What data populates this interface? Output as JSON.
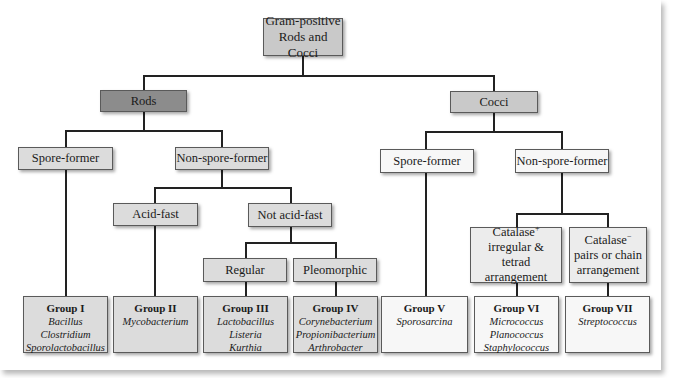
{
  "diagram": {
    "root": "Gram-positive Rods and Cocci",
    "rods": {
      "label": "Rods",
      "spore_former": "Spore-former",
      "non_spore_former": "Non-spore-former",
      "acid_fast": "Acid-fast",
      "not_acid_fast": "Not acid-fast",
      "regular": "Regular",
      "pleomorphic": "Pleomorphic"
    },
    "cocci": {
      "label": "Cocci",
      "spore_former": "Spore-former",
      "non_spore_former": "Non-spore-former",
      "catalase_pos": {
        "title": "Catalase",
        "sign": "+",
        "desc": "irregular & tetrad arrangement"
      },
      "catalase_neg": {
        "title": "Catalase",
        "sign": "−",
        "desc": "pairs or chain arrangement"
      }
    },
    "groups": [
      {
        "title": "Group I",
        "genera": [
          "Bacillus",
          "Clostridium",
          "Sporolactobacillus"
        ]
      },
      {
        "title": "Group II",
        "genera": [
          "Mycobacterium"
        ]
      },
      {
        "title": "Group III",
        "genera": [
          "Lactobacillus",
          "Listeria",
          "Kurthia"
        ]
      },
      {
        "title": "Group IV",
        "genera": [
          "Corynebacterium",
          "Propionibacterium",
          "Arthrobacter"
        ]
      },
      {
        "title": "Group V",
        "genera": [
          "Sporosarcina"
        ]
      },
      {
        "title": "Group VI",
        "genera": [
          "Micrococcus",
          "Planococcus",
          "Staphylococcus"
        ]
      },
      {
        "title": "Group VII",
        "genera": [
          "Streptococcus"
        ]
      }
    ]
  },
  "colors": {
    "rods_fill": "#8c8c8c",
    "cocci_fill": "#c9c9c9",
    "rod_branch_fill": "#dcdcdc",
    "cocci_branch_fill": "#f7f7f7",
    "connector": "#222222"
  }
}
